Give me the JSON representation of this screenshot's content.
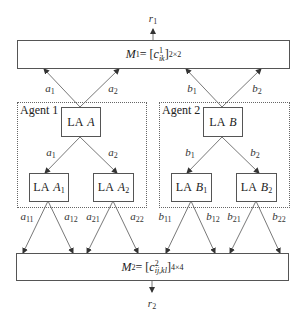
{
  "outputs": {
    "r1": "r",
    "r1_sub": "1",
    "r2": "r",
    "r2_sub": "2"
  },
  "matrix_top": {
    "symbol": "M",
    "sup": "1",
    "eq": " = [",
    "c": "c",
    "c_sup": "1",
    "c_sub": "ik",
    "close": "]",
    "dim": "2×2"
  },
  "matrix_bottom": {
    "symbol": "M",
    "sup": "2",
    "eq": " = [",
    "c": "c",
    "c_sup": "2",
    "c_sub": "ij,kl",
    "close": "]",
    "dim": "4×4"
  },
  "agents": [
    {
      "title": "Agent 1",
      "root": {
        "prefix": "LA",
        "name": "A",
        "sub": ""
      },
      "children": [
        {
          "prefix": "LA",
          "name": "A",
          "sub": "1"
        },
        {
          "prefix": "LA",
          "name": "A",
          "sub": "2"
        }
      ],
      "up_labels": [
        {
          "v": "a",
          "s": "1"
        },
        {
          "v": "a",
          "s": "2"
        }
      ],
      "down_labels": [
        {
          "v": "a",
          "s": "1"
        },
        {
          "v": "a",
          "s": "2"
        }
      ],
      "bottom_labels": [
        {
          "v": "a",
          "s": "11"
        },
        {
          "v": "a",
          "s": "12"
        },
        {
          "v": "a",
          "s": "21"
        },
        {
          "v": "a",
          "s": "22"
        }
      ]
    },
    {
      "title": "Agent 2",
      "root": {
        "prefix": "LA",
        "name": "B",
        "sub": ""
      },
      "children": [
        {
          "prefix": "LA",
          "name": "B",
          "sub": "1"
        },
        {
          "prefix": "LA",
          "name": "B",
          "sub": "2"
        }
      ],
      "up_labels": [
        {
          "v": "b",
          "s": "1"
        },
        {
          "v": "b",
          "s": "2"
        }
      ],
      "down_labels": [
        {
          "v": "b",
          "s": "1"
        },
        {
          "v": "b",
          "s": "2"
        }
      ],
      "bottom_labels": [
        {
          "v": "b",
          "s": "11"
        },
        {
          "v": "b",
          "s": "12"
        },
        {
          "v": "b",
          "s": "21"
        },
        {
          "v": "b",
          "s": "22"
        }
      ]
    }
  ]
}
